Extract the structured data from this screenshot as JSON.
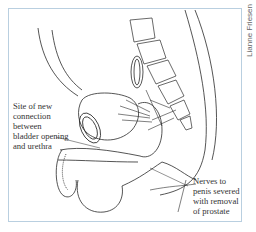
{
  "figure": {
    "credit": "Lianne Friesen",
    "labels": {
      "left": {
        "lines": [
          "Site of new",
          "connection",
          "between",
          "bladder opening",
          "and urethra"
        ]
      },
      "right": {
        "lines": [
          "Nerves to",
          "penis severed",
          "with removal",
          "of prostate"
        ]
      }
    },
    "colors": {
      "frame_border": "#b9cfe0",
      "line_art": "#2a2a2a",
      "text": "#333333"
    }
  }
}
